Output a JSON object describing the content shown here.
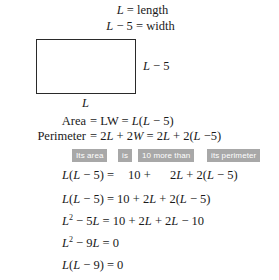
{
  "document": {
    "type": "algebra-word-problem-worksheet",
    "background_color": "#ffffff",
    "text_color": "#1a1a1a",
    "highlight_color": "#a8a8a8",
    "highlight_text_color": "#ffffff"
  },
  "definitions": {
    "length": "L = length",
    "width": "L − 5 = width"
  },
  "figure": {
    "shape": "rectangle",
    "side_label": "L − 5",
    "bottom_label": "L"
  },
  "formulas": [
    {
      "label": "Area",
      "body": "= LW = L(L − 5)"
    },
    {
      "label": "Perimeter",
      "body": "= 2L + 2W = 2L + 2(L −5)"
    }
  ],
  "translation_chips": [
    "Its area",
    "is",
    "10 more than",
    "its perimeter"
  ],
  "aligned_equation": {
    "left": "L(L − 5) =",
    "middle": "10 +",
    "right": "2L + 2(L − 5)"
  },
  "steps": [
    "L(L − 5) = 10 + 2L + 2(L − 5)",
    "L² − 5L = 10 + 2L + 2L − 10",
    "L² − 9L = 0",
    "L(L − 9) = 0"
  ]
}
